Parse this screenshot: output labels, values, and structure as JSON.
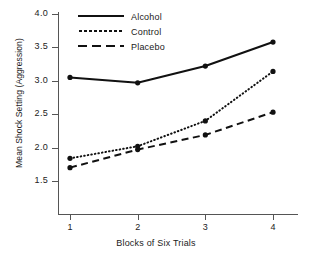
{
  "chart_data": {
    "type": "line",
    "title": "",
    "xlabel": "Blocks of Six Trials",
    "ylabel": "Mean Shock Setting (Aggression)",
    "x": [
      1,
      2,
      3,
      4
    ],
    "xticklabels": [
      "1",
      "2",
      "3",
      "4"
    ],
    "yticklabels": [
      "4.0",
      "3.5",
      "3.0",
      "2.5",
      "2.0",
      "1.5"
    ],
    "yticks": [
      4.0,
      3.5,
      3.0,
      2.5,
      2.0,
      1.5
    ],
    "xlim": [
      0.72,
      4.28
    ],
    "ylim": [
      1.35,
      4.05
    ],
    "grid": false,
    "legend_position": "top-center",
    "markers": "filled-circle",
    "series": [
      {
        "name": "Alcohol",
        "style": "solid",
        "values": [
          3.05,
          2.97,
          3.22,
          3.58
        ]
      },
      {
        "name": "Control",
        "style": "dotted",
        "values": [
          1.84,
          2.02,
          2.4,
          3.14
        ]
      },
      {
        "name": "Placebo",
        "style": "dashed",
        "values": [
          1.7,
          1.97,
          2.19,
          2.53
        ]
      }
    ]
  },
  "legend": {
    "items": [
      {
        "label": "Alcohol"
      },
      {
        "label": "Control"
      },
      {
        "label": "Placebo"
      }
    ]
  },
  "axes": {
    "x_title": "Blocks of Six Trials",
    "y_title": "Mean Shock Setting (Aggression)",
    "x_tick_labels": [
      "1",
      "2",
      "3",
      "4"
    ],
    "y_tick_labels": [
      "4.0",
      "3.5",
      "3.0",
      "2.5",
      "2.0",
      "1.5"
    ]
  },
  "colors": {
    "ink": "#111111",
    "axis": "#555555",
    "background": "#ffffff"
  }
}
